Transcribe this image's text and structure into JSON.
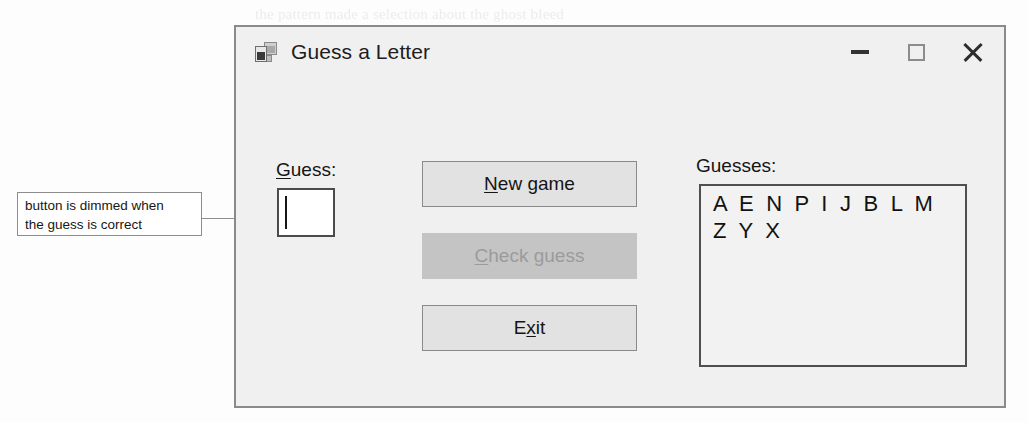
{
  "page": {
    "background_color": "#fdfdfd",
    "ghost_text": [
      "the pattern made a selection about the ghost bleed",
      "a few passed a random test. Help parts in the form",
      "with several complex to reset the form is by the user",
      "III",
      "the  guess  in  the  list",
      "of  the  letters  a  user",
      "to  enter  a  single  character",
      "when  the  guess  is  correct"
    ]
  },
  "annotation": {
    "name": "dimmed-button-note",
    "lines": [
      "button is dimmed when",
      "the guess is correct"
    ],
    "border_color": "#8d8d8d",
    "leader_color": "#8f8f8f"
  },
  "dialog": {
    "title": "Guess a Letter",
    "icon": "windows-form-icon",
    "background_color": "#f0f0f0",
    "border_color": "#888a8c",
    "controls": {
      "minimize": "—",
      "maximize": "□",
      "close": "✕"
    }
  },
  "form": {
    "guess": {
      "label_prefix": "",
      "label_accel": "G",
      "label_suffix": "uess:",
      "input_value": "",
      "input_placeholder": ""
    },
    "guesses": {
      "label_prefix": "",
      "label_accel": "",
      "label_suffix": "Guesses:",
      "letters": "A E N P I J B L M Z Y X"
    },
    "buttons": [
      {
        "name": "new-game-button",
        "prefix": "",
        "accel": "N",
        "suffix": "ew game",
        "enabled": true
      },
      {
        "name": "check-guess-button",
        "prefix": "",
        "accel": "C",
        "suffix": "heck guess",
        "enabled": false
      },
      {
        "name": "exit-button",
        "prefix": "E",
        "accel": "x",
        "suffix": "it",
        "enabled": true
      }
    ]
  }
}
